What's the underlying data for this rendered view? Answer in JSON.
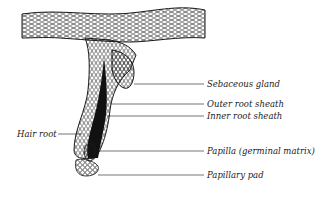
{
  "diagram": {
    "labels": [
      {
        "id": "sebaceous-gland",
        "text": "Sebaceous gland"
      },
      {
        "id": "outer-root-sheath",
        "text": "Outer root sheath"
      },
      {
        "id": "inner-root-sheath",
        "text": "Inner root sheath"
      },
      {
        "id": "hair-root",
        "text": "Hair root"
      },
      {
        "id": "papilla",
        "text": "Papilla (germinal matrix)"
      },
      {
        "id": "papillary-pad",
        "text": "Papillary pad"
      }
    ]
  },
  "colors": {
    "ink": "#1a1a1a",
    "background": "#ffffff"
  }
}
